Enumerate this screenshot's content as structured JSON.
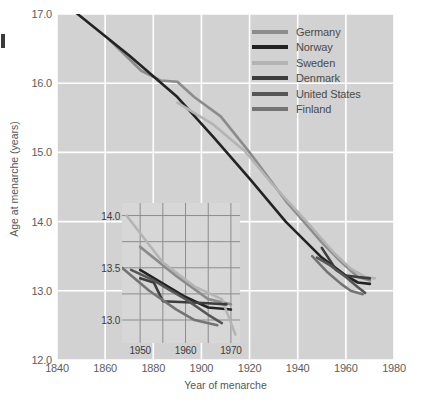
{
  "chart_data": {
    "type": "line",
    "title": "",
    "xlabel": "Year of menarche",
    "ylabel": "Age at menarche (years)",
    "xlim": [
      1840,
      1980
    ],
    "ylim": [
      12.0,
      17.0
    ],
    "xticks": [
      1840,
      1860,
      1880,
      1900,
      1920,
      1940,
      1960,
      1980
    ],
    "yticks": [
      "12.0",
      "13.0",
      "14.0",
      "15.0",
      "16.0",
      "17.0"
    ],
    "grid": true,
    "legend_position": "top-right",
    "legend": [
      "Germany",
      "Norway",
      "Sweden",
      "Denmark",
      "United States",
      "Finland"
    ],
    "colors": {
      "Germany": "#8c8c8c",
      "Norway": "#232323",
      "Sweden": "#b4b4b4",
      "Denmark": "#3d3d3d",
      "United States": "#565656",
      "Finland": "#747474"
    },
    "series": [
      {
        "name": "Germany",
        "color": "#8c8c8c",
        "x": [
          1862,
          1875,
          1883,
          1890,
          1897,
          1908,
          1920,
          1935,
          1950,
          1958,
          1965,
          1970
        ],
        "y": [
          16.62,
          16.18,
          16.04,
          16.02,
          15.8,
          15.52,
          15.0,
          14.3,
          13.7,
          13.42,
          13.2,
          13.15
        ]
      },
      {
        "name": "Norway",
        "color": "#232323",
        "x": [
          1845,
          1870,
          1890,
          1905,
          1920,
          1935,
          1950,
          1960,
          1965,
          1970
        ],
        "y": [
          17.1,
          16.4,
          15.8,
          15.22,
          14.62,
          14.0,
          13.48,
          13.22,
          13.12,
          13.1
        ]
      },
      {
        "name": "Sweden",
        "color": "#b4b4b4",
        "x": [
          1890,
          1905,
          1918,
          1930,
          1945,
          1955,
          1962,
          1968,
          1972
        ],
        "y": [
          15.72,
          15.4,
          15.02,
          14.52,
          13.95,
          13.55,
          13.32,
          13.2,
          13.18
        ]
      },
      {
        "name": "Denmark",
        "color": "#3d3d3d",
        "x": [
          1950,
          1956,
          1960,
          1965,
          1970
        ],
        "y": [
          13.62,
          13.3,
          13.22,
          13.2,
          13.18
        ]
      },
      {
        "name": "United States",
        "color": "#565656",
        "x": [
          1948,
          1953,
          1956,
          1960,
          1965,
          1968
        ],
        "y": [
          13.48,
          13.38,
          13.3,
          13.2,
          13.05,
          12.97
        ]
      },
      {
        "name": "Finland",
        "color": "#747474",
        "x": [
          1946,
          1952,
          1958,
          1962,
          1967
        ],
        "y": [
          13.5,
          13.28,
          13.1,
          13.0,
          12.95
        ]
      }
    ]
  },
  "inset_chart": {
    "type": "line",
    "xlim": [
      1946,
      1972
    ],
    "ylim": [
      12.78,
      14.12
    ],
    "xticks": [
      1950,
      1960,
      1970
    ],
    "yticks": [
      "13.0",
      "13.5",
      "14.0"
    ],
    "grid": true,
    "series": [
      {
        "name": "Germany",
        "color": "#8c8c8c",
        "x": [
          1950,
          1958,
          1965,
          1970
        ],
        "y": [
          13.7,
          13.42,
          13.2,
          13.15
        ]
      },
      {
        "name": "Norway",
        "color": "#232323",
        "x": [
          1950,
          1960,
          1965,
          1970
        ],
        "y": [
          13.48,
          13.22,
          13.12,
          13.1
        ]
      },
      {
        "name": "Sweden",
        "color": "#b4b4b4",
        "x": [
          1947,
          1955,
          1962,
          1968,
          1971
        ],
        "y": [
          14.0,
          13.55,
          13.32,
          13.2,
          12.86
        ]
      },
      {
        "name": "Denmark",
        "color": "#3d3d3d",
        "x": [
          1950,
          1953,
          1955,
          1960,
          1965,
          1969
        ],
        "y": [
          13.4,
          13.36,
          13.18,
          13.17,
          13.16,
          13.15
        ]
      },
      {
        "name": "United States",
        "color": "#565656",
        "x": [
          1948,
          1953,
          1956,
          1960,
          1965,
          1968
        ],
        "y": [
          13.48,
          13.38,
          13.3,
          13.2,
          13.05,
          12.97
        ]
      },
      {
        "name": "Finland",
        "color": "#747474",
        "x": [
          1946,
          1952,
          1958,
          1962,
          1967
        ],
        "y": [
          13.5,
          13.28,
          13.1,
          13.0,
          12.95
        ]
      }
    ]
  }
}
